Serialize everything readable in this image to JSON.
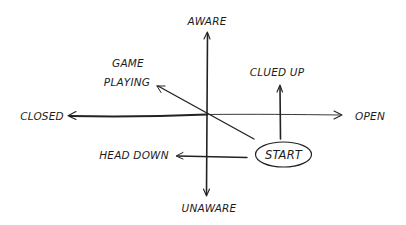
{
  "diagram": {
    "axes": {
      "vertical": {
        "top_label": "AWARE",
        "bottom_label": "UNAWARE"
      },
      "horizontal": {
        "left_label": "CLOSED",
        "right_label": "OPEN"
      }
    },
    "start_node": {
      "label": "START"
    },
    "outcomes": [
      {
        "id": "clued-up",
        "lines": [
          "CLUED UP"
        ],
        "direction": "up"
      },
      {
        "id": "game-playing",
        "lines": [
          "GAME",
          "PLAYING"
        ],
        "direction": "up-left"
      },
      {
        "id": "head-down",
        "lines": [
          "HEAD DOWN"
        ],
        "direction": "left"
      }
    ],
    "colors": {
      "ink": "#222222",
      "background": "#ffffff"
    }
  }
}
